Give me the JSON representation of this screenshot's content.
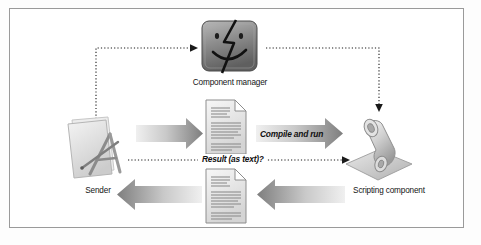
{
  "figure": {
    "background": "#ffffff",
    "frame_color": "#9a9a9a"
  },
  "nodes": [
    {
      "id": "component-manager",
      "label": "Component manager",
      "icon": "mac-finder-face-icon",
      "x": 196,
      "y": 19,
      "w": 67,
      "h": 56
    },
    {
      "id": "sender",
      "label": "Sender",
      "icon": "document-with-ruler-pencil-icon",
      "x": 62,
      "y": 112,
      "w": 72,
      "h": 72
    },
    {
      "id": "scripting-component",
      "label": "Scripting component",
      "icon": "scroll-on-platform-icon",
      "x": 342,
      "y": 112,
      "w": 74,
      "h": 72
    },
    {
      "id": "script-text-document",
      "label": "",
      "icon": "text-document-icon",
      "x": 204,
      "y": 99,
      "w": 44,
      "h": 56
    },
    {
      "id": "result-text-document",
      "label": "",
      "icon": "text-document-icon",
      "x": 204,
      "y": 168,
      "w": 44,
      "h": 56
    }
  ],
  "arrows": [
    {
      "id": "sender-to-document",
      "label": "",
      "direction": "right",
      "style": "solid-gradient"
    },
    {
      "id": "compile-and-run",
      "label": "Compile and run",
      "direction": "right",
      "style": "solid-gradient"
    },
    {
      "id": "result-as-text",
      "label": "Result (as text)?",
      "direction": "right",
      "style": "dotted"
    },
    {
      "id": "component-to-scripting",
      "label": "",
      "direction": "down",
      "style": "dotted"
    },
    {
      "id": "sender-to-component",
      "label": "",
      "direction": "right",
      "style": "dotted"
    },
    {
      "id": "scripting-to-result",
      "label": "",
      "direction": "left",
      "style": "solid-gradient"
    },
    {
      "id": "result-to-sender",
      "label": "",
      "direction": "left",
      "style": "solid-gradient"
    }
  ],
  "colors": {
    "arrow_light": "#eaeaea",
    "arrow_dark": "#7d7d7d",
    "dotted": "#1a1a1a",
    "text": "#141414"
  }
}
